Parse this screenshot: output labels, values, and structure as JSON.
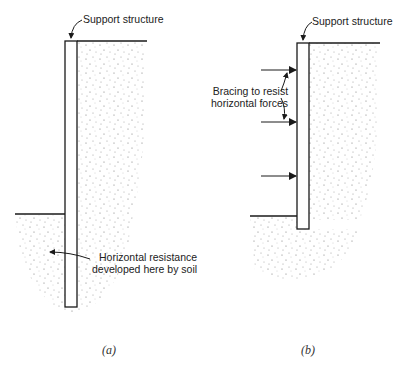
{
  "panels": [
    {
      "id": "a",
      "caption": "(a)",
      "labels": {
        "top": "Support structure",
        "soil_line1": "Horizontal resistance",
        "soil_line2": "developed here by soil"
      }
    },
    {
      "id": "b",
      "caption": "(b)",
      "labels": {
        "top": "Support structure",
        "bracing_line1": "Bracing to resist",
        "bracing_line2": "horizontal forces"
      },
      "bracing_arrow_count": 3
    }
  ],
  "colors": {
    "line": "#1a1a1a",
    "soil_dot": "#7a7a7a"
  }
}
